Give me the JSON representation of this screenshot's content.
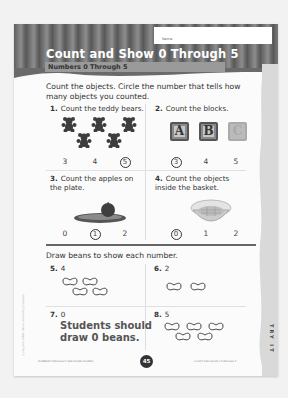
{
  "header": {
    "name_label": "Name",
    "title": "Count and Show 0 Through 5",
    "subtitle": "Numbers 0 Through 5"
  },
  "instructions": {
    "part1": "Count the objects. Circle the number that tells how many objects you counted.",
    "part2": "Draw beans to show each number."
  },
  "questions": [
    {
      "num": "1.",
      "text": "Count the teddy bears.",
      "choices": [
        "3",
        "4",
        "5"
      ],
      "circled": "5",
      "object": "teddy-bear",
      "count": 5
    },
    {
      "num": "2.",
      "text": "Count the blocks.",
      "choices": [
        "3",
        "4",
        "5"
      ],
      "circled": "3",
      "object": "block",
      "blocks": [
        "A",
        "B",
        "C"
      ]
    },
    {
      "num": "3.",
      "text": "Count the apples on the plate.",
      "choices": [
        "0",
        "1",
        "2"
      ],
      "circled": "1",
      "object": "apple-plate"
    },
    {
      "num": "4.",
      "text": "Count the objects inside the basket.",
      "choices": [
        "0",
        "1",
        "2"
      ],
      "circled": "0",
      "object": "empty-basket"
    },
    {
      "num": "5.",
      "value": "4",
      "beans": 4
    },
    {
      "num": "6.",
      "value": "2",
      "beans": 2
    },
    {
      "num": "7.",
      "value": "0",
      "answer_text_line1": "Students should",
      "answer_text_line2": "draw 0 beans."
    },
    {
      "num": "8.",
      "value": "5",
      "beans": 5
    }
  ],
  "side_tab": "TRY IT",
  "footer": {
    "left": "NUMBERS THROUGH 5 AND PLANE FIGURES",
    "page_number": "45",
    "right": "COUNT AND SHOW 0 THROUGH 5"
  },
  "copyright": "© Houghton Mifflin Harcourt Publishing Company"
}
